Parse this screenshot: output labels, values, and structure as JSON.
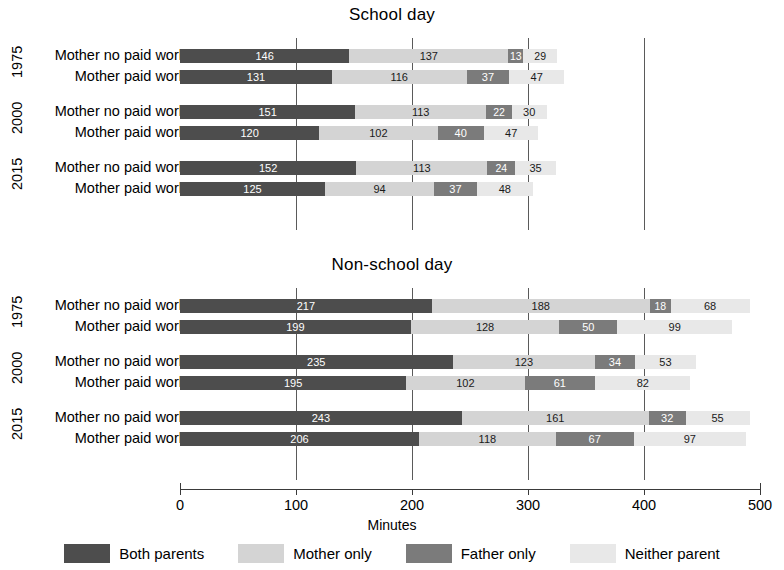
{
  "chart_data": {
    "type": "bar",
    "orientation": "horizontal",
    "stacked": true,
    "title": "",
    "xlabel": "Minutes",
    "ylabel": "",
    "xlim": [
      0,
      500
    ],
    "xticks": [
      0,
      100,
      200,
      300,
      400,
      500
    ],
    "xtick_labels": [
      "0",
      "100",
      "200",
      "300",
      "400",
      "500"
    ],
    "gridlines": [
      100,
      200,
      300,
      400
    ],
    "grid": true,
    "legend_position": "bottom",
    "series": [
      {
        "name": "Both parents",
        "color": "#4d4d4d"
      },
      {
        "name": "Mother only",
        "color": "#d4d4d4"
      },
      {
        "name": "Father only",
        "color": "#7b7b7b"
      },
      {
        "name": "Neither parent",
        "color": "#e8e8e8"
      }
    ],
    "panels": [
      {
        "title": "School day",
        "groups": [
          {
            "year": "1975",
            "rows": [
              {
                "label": "Mother no paid work",
                "values": [
                  146,
                  137,
                  13,
                  29
                ]
              },
              {
                "label": "Mother paid work",
                "values": [
                  131,
                  116,
                  37,
                  47
                ]
              }
            ]
          },
          {
            "year": "2000",
            "rows": [
              {
                "label": "Mother no paid work",
                "values": [
                  151,
                  113,
                  22,
                  30
                ]
              },
              {
                "label": "Mother paid work",
                "values": [
                  120,
                  102,
                  40,
                  47
                ]
              }
            ]
          },
          {
            "year": "2015",
            "rows": [
              {
                "label": "Mother no paid work",
                "values": [
                  152,
                  113,
                  24,
                  35
                ]
              },
              {
                "label": "Mother paid work",
                "values": [
                  125,
                  94,
                  37,
                  48
                ]
              }
            ]
          }
        ]
      },
      {
        "title": "Non-school day",
        "groups": [
          {
            "year": "1975",
            "rows": [
              {
                "label": "Mother no paid work",
                "values": [
                  217,
                  188,
                  18,
                  68
                ]
              },
              {
                "label": "Mother paid work",
                "values": [
                  199,
                  128,
                  50,
                  99
                ]
              }
            ]
          },
          {
            "year": "2000",
            "rows": [
              {
                "label": "Mother no paid work",
                "values": [
                  235,
                  123,
                  34,
                  53
                ]
              },
              {
                "label": "Mother paid work",
                "values": [
                  195,
                  102,
                  61,
                  82
                ]
              }
            ]
          },
          {
            "year": "2015",
            "rows": [
              {
                "label": "Mother no paid work",
                "values": [
                  243,
                  161,
                  32,
                  55
                ]
              },
              {
                "label": "Mother paid work",
                "values": [
                  206,
                  118,
                  67,
                  97
                ]
              }
            ]
          }
        ]
      }
    ]
  }
}
